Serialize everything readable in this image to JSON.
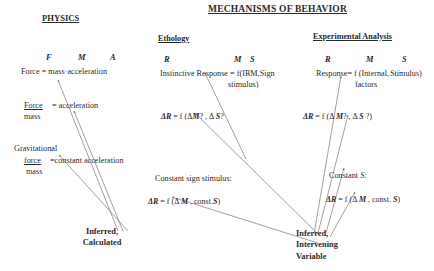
{
  "figure": {
    "main_title": "MECHANISMS OF BEHAVIOR",
    "columns": {
      "physics": {
        "title": "PHYSICS",
        "vars": {
          "f": "F",
          "m": "M",
          "a": "A"
        },
        "eq1": "Force = mass·acceleration",
        "eq2_num": "Force",
        "eq2_den": "mass",
        "eq2_rhs": "= acceleration",
        "eq3_label": "Gravitational",
        "eq3_num": "force",
        "eq3_den": "mass",
        "eq3_rhs": "=constant acceleration",
        "outcome_line1": "Inferred,",
        "outcome_line2": "Calculated"
      },
      "ethology": {
        "title": "Ethology",
        "var_r": "R",
        "var_m": "M",
        "var_s": "S",
        "eq1_lhs": "Instinctive Response = f(IRM,Sign",
        "eq1_cont": "stimulus)",
        "eq2": "ΔR = f (ΔM? , Δ S?",
        "constant_note": "Constant sign stimulus:",
        "eq3": "ΔR = f (Δ M , const.S)"
      },
      "experimental_analysis": {
        "title": "Experimental Analysis",
        "var_r": "R",
        "var_m": "M",
        "var_s": "S",
        "eq1_lhs": "Response= f (Internal,",
        "eq1_s": "Stimulus)",
        "eq1_cont": "factors",
        "eq2": "ΔR = f (Δ M? , Δ S ?)",
        "constant_note": "Constant S:",
        "eq3": "ΔR = f (Δ M ,  const. S)"
      }
    },
    "center_outcome": {
      "line1": "Inferred,",
      "line2": "Intervening",
      "line3": "Variable"
    }
  },
  "style": {
    "ink": "#2b2b2b",
    "arrow_stroke": "#6f6f6f",
    "background": "#ffffff"
  }
}
